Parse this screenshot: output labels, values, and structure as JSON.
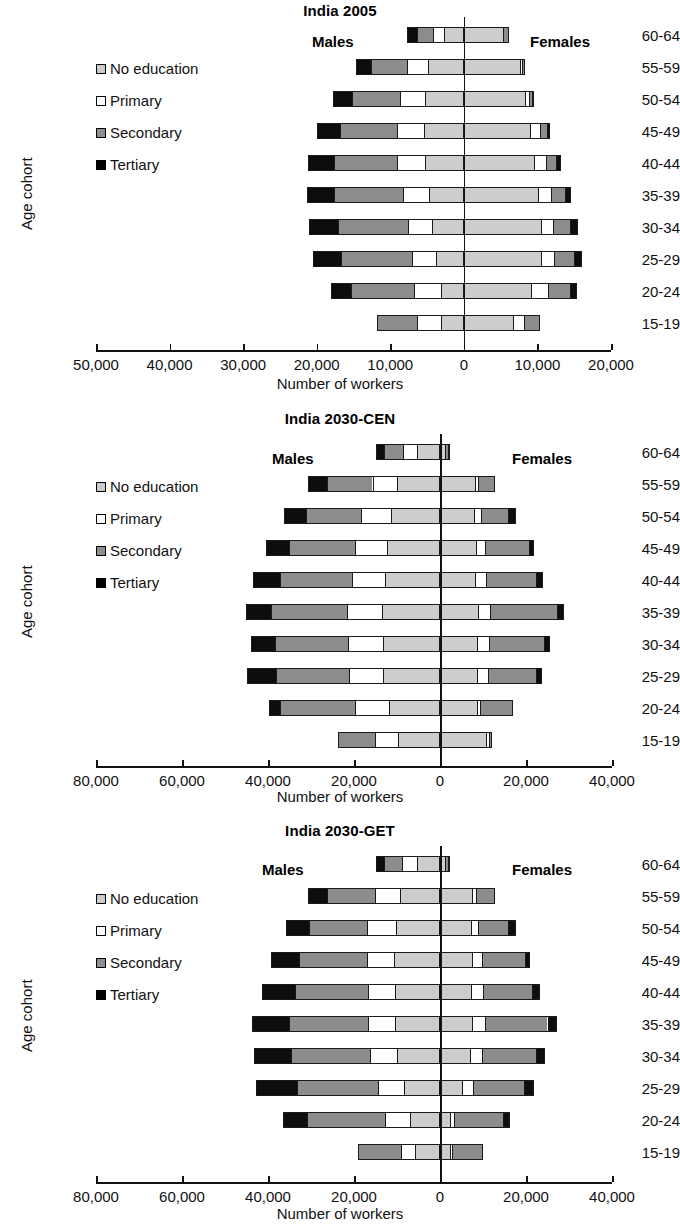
{
  "figure": {
    "axis_x_title": "Number of workers",
    "axis_y_title": "Age cohort",
    "males_label": "Males",
    "females_label": "Females",
    "categories": [
      "60-64",
      "55-59",
      "50-54",
      "45-49",
      "40-44",
      "35-39",
      "30-34",
      "25-29",
      "20-24",
      "15-19"
    ],
    "legend": [
      {
        "key": "no_education",
        "label": "No education",
        "color": "#cdcdcd"
      },
      {
        "key": "primary",
        "label": "Primary",
        "color": "#ffffff"
      },
      {
        "key": "secondary",
        "label": "Secondary",
        "color": "#8c8c8c"
      },
      {
        "key": "tertiary",
        "label": "Tertiary",
        "color": "#0d0d0d"
      }
    ]
  },
  "chart_data": [
    {
      "type": "bar",
      "subtype": "population-pyramid-stacked",
      "title": "India 2005",
      "xlabel": "Number of workers",
      "ylabel": "Age cohort",
      "grid": false,
      "legend_position": "inside-left",
      "xticks": [
        -50000,
        -40000,
        -30000,
        -20000,
        -10000,
        0,
        10000,
        20000
      ],
      "xtick_labels": [
        "50,000",
        "40,000",
        "30,000",
        "20,000",
        "10,000",
        "0",
        "10,000",
        "20,000"
      ],
      "xlim": [
        -50000,
        20000
      ],
      "categories": [
        "60-64",
        "55-59",
        "50-54",
        "45-49",
        "40-44",
        "35-39",
        "30-34",
        "25-29",
        "20-24",
        "15-19"
      ],
      "males": {
        "note": "segments ordered outward-to-center: tertiary, secondary, primary, no_education",
        "tertiary": [
          1200,
          2000,
          2500,
          3000,
          3400,
          3600,
          3800,
          3700,
          2600,
          0
        ],
        "secondary": [
          2300,
          5000,
          6600,
          7800,
          8700,
          9500,
          9600,
          9800,
          8800,
          5400
        ],
        "primary": [
          1500,
          2900,
          3500,
          3700,
          3900,
          3500,
          3400,
          3300,
          3700,
          3300
        ],
        "no_education": [
          2700,
          4800,
          5200,
          5400,
          5200,
          4700,
          4200,
          3700,
          3000,
          3100
        ]
      },
      "females": {
        "note": "segments ordered center-to-outward: no_education, primary, secondary, tertiary",
        "no_education": [
          5400,
          7800,
          8400,
          9100,
          9600,
          10200,
          10500,
          10600,
          9200,
          6700
        ],
        "primary": [
          0,
          300,
          600,
          1300,
          1700,
          1700,
          1700,
          1700,
          2300,
          1500
        ],
        "secondary": [
          800,
          200,
          400,
          1000,
          1400,
          2000,
          2400,
          2800,
          3100,
          2100
        ],
        "tertiary": [
          0,
          0,
          200,
          300,
          500,
          700,
          900,
          900,
          800,
          0
        ]
      }
    },
    {
      "type": "bar",
      "subtype": "population-pyramid-stacked",
      "title": "India 2030-CEN",
      "xlabel": "Number of workers",
      "ylabel": "Age cohort",
      "grid": false,
      "legend_position": "inside-left",
      "xticks": [
        -80000,
        -60000,
        -40000,
        -20000,
        0,
        20000,
        40000
      ],
      "xtick_labels": [
        "80,000",
        "60,000",
        "40,000",
        "20,000",
        "0",
        "20,000",
        "40,000"
      ],
      "xlim": [
        -80000,
        40000
      ],
      "categories": [
        "60-64",
        "55-59",
        "50-54",
        "45-49",
        "40-44",
        "35-39",
        "30-34",
        "25-29",
        "20-24",
        "15-19"
      ],
      "males": {
        "tertiary": [
          1700,
          4200,
          4800,
          5000,
          6100,
          5800,
          5500,
          6500,
          2300,
          0
        ],
        "secondary": [
          4600,
          10800,
          13100,
          15700,
          16800,
          17700,
          17000,
          17200,
          17600,
          8600
        ],
        "primary": [
          3400,
          5900,
          7100,
          7400,
          7800,
          8400,
          8300,
          8000,
          8100,
          5400
        ],
        "no_education": [
          5300,
          9800,
          11200,
          12300,
          12700,
          13300,
          13200,
          13100,
          11700,
          9800
        ]
      },
      "females": {
        "no_education": [
          1200,
          8100,
          7800,
          8200,
          8000,
          8700,
          8500,
          8500,
          8700,
          10900
        ],
        "primary": [
          0,
          800,
          1800,
          2300,
          2600,
          2900,
          2900,
          2600,
          700,
          600
        ],
        "secondary": [
          800,
          4000,
          6500,
          10400,
          12000,
          15800,
          12900,
          11500,
          7500,
          700
        ],
        "tertiary": [
          400,
          0,
          1600,
          900,
          1300,
          1400,
          1300,
          1200,
          0,
          0
        ]
      }
    },
    {
      "type": "bar",
      "subtype": "population-pyramid-stacked",
      "title": "India 2030-GET",
      "xlabel": "Number of workers",
      "ylabel": "Age cohort",
      "grid": false,
      "legend_position": "inside-left",
      "xticks": [
        -80000,
        -60000,
        -40000,
        -20000,
        0,
        20000,
        40000
      ],
      "xtick_labels": [
        "80,000",
        "60,000",
        "40,000",
        "20,000",
        "0",
        "20,000",
        "40,000"
      ],
      "xlim": [
        -80000,
        40000
      ],
      "categories": [
        "60-64",
        "55-59",
        "50-54",
        "45-49",
        "40-44",
        "35-39",
        "30-34",
        "25-29",
        "20-24",
        "15-19"
      ],
      "males": {
        "tertiary": [
          1700,
          4200,
          5300,
          6300,
          7600,
          8500,
          8600,
          9600,
          5200,
          0
        ],
        "secondary": [
          4500,
          11300,
          13600,
          16000,
          17200,
          18600,
          18500,
          19000,
          18600,
          9900
        ],
        "primary": [
          3600,
          5900,
          6800,
          6400,
          6200,
          6300,
          6300,
          6000,
          5800,
          3300
        ],
        "no_education": [
          5200,
          9300,
          10200,
          10500,
          10400,
          10300,
          9900,
          8300,
          6800,
          5800
        ]
      },
      "females": {
        "no_education": [
          1200,
          7600,
          7200,
          7300,
          7200,
          7400,
          6800,
          4900,
          2200,
          2100
        ],
        "primary": [
          0,
          800,
          1600,
          2400,
          2700,
          2900,
          3000,
          2600,
          900,
          700
        ],
        "secondary": [
          800,
          4400,
          7200,
          10200,
          11700,
          14900,
          12700,
          12200,
          11700,
          7200
        ],
        "tertiary": [
          400,
          0,
          1600,
          1100,
          1700,
          2100,
          2000,
          2200,
          1400,
          0
        ]
      }
    }
  ]
}
